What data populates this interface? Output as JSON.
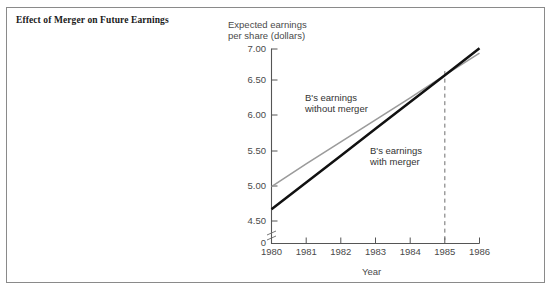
{
  "figure": {
    "title": "Effect of Merger on Future\nEarnings",
    "frame_color": "#8a8a8a",
    "background": "#ffffff"
  },
  "chart_data": {
    "type": "line",
    "title": "Effect of Merger on Future Earnings",
    "xlabel": "Year",
    "ylabel": "Expected earnings\nper share (dollars)",
    "x": [
      1980,
      1981,
      1982,
      1983,
      1984,
      1985,
      1986
    ],
    "xlim": [
      1980,
      1986
    ],
    "ylim": [
      4.25,
      7.0
    ],
    "y_ticks": [
      "0",
      "4.50",
      "5.00",
      "5.50",
      "6.00",
      "6.50",
      "7.00"
    ],
    "y_tick_values": [
      0,
      4.5,
      5.0,
      5.5,
      6.0,
      6.5,
      7.0
    ],
    "x_ticks": [
      "1980",
      "1981",
      "1982",
      "1983",
      "1984",
      "1985",
      "1986"
    ],
    "axis_break": true,
    "grid": false,
    "legend": "none",
    "series": [
      {
        "name": "B's earnings without merger",
        "color": "#9b9b9b",
        "width": 1.6,
        "values": [
          5.0,
          5.33,
          5.65,
          5.97,
          6.29,
          6.62,
          6.94
        ]
      },
      {
        "name": "B's earnings with merger",
        "color": "#111111",
        "width": 2.5,
        "values": [
          4.67,
          5.06,
          5.45,
          5.84,
          6.23,
          6.62,
          7.01
        ]
      }
    ],
    "annotations": [
      {
        "id": "annot-without-merger",
        "text": "B's earnings\nwithout merger",
        "x": 1981.0,
        "y": 6.22
      },
      {
        "id": "annot-with-merger",
        "text": "B's earnings\nwith merger",
        "x": 1983.05,
        "y": 5.69
      }
    ],
    "markers": [
      {
        "id": "crossover-marker",
        "type": "vertical-dashed-line",
        "x": 1985,
        "y_from": 4.25,
        "y_to": 6.62,
        "label": "1985"
      }
    ]
  }
}
